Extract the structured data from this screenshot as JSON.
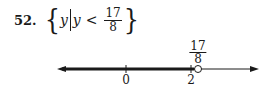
{
  "problem": {
    "number": "52.",
    "variable": "y",
    "condition_var": "y",
    "relation": "<",
    "fraction": {
      "numerator": "17",
      "denominator": "8"
    }
  },
  "number_line": {
    "ticks": [
      {
        "label": "0",
        "x": 126
      },
      {
        "label": "2",
        "x": 191
      }
    ],
    "endpoint": {
      "numerator": "17",
      "denominator": "8",
      "x": 198,
      "type": "open-circle"
    },
    "shaded": "left-of-endpoint",
    "color": "#1a1a1a"
  }
}
